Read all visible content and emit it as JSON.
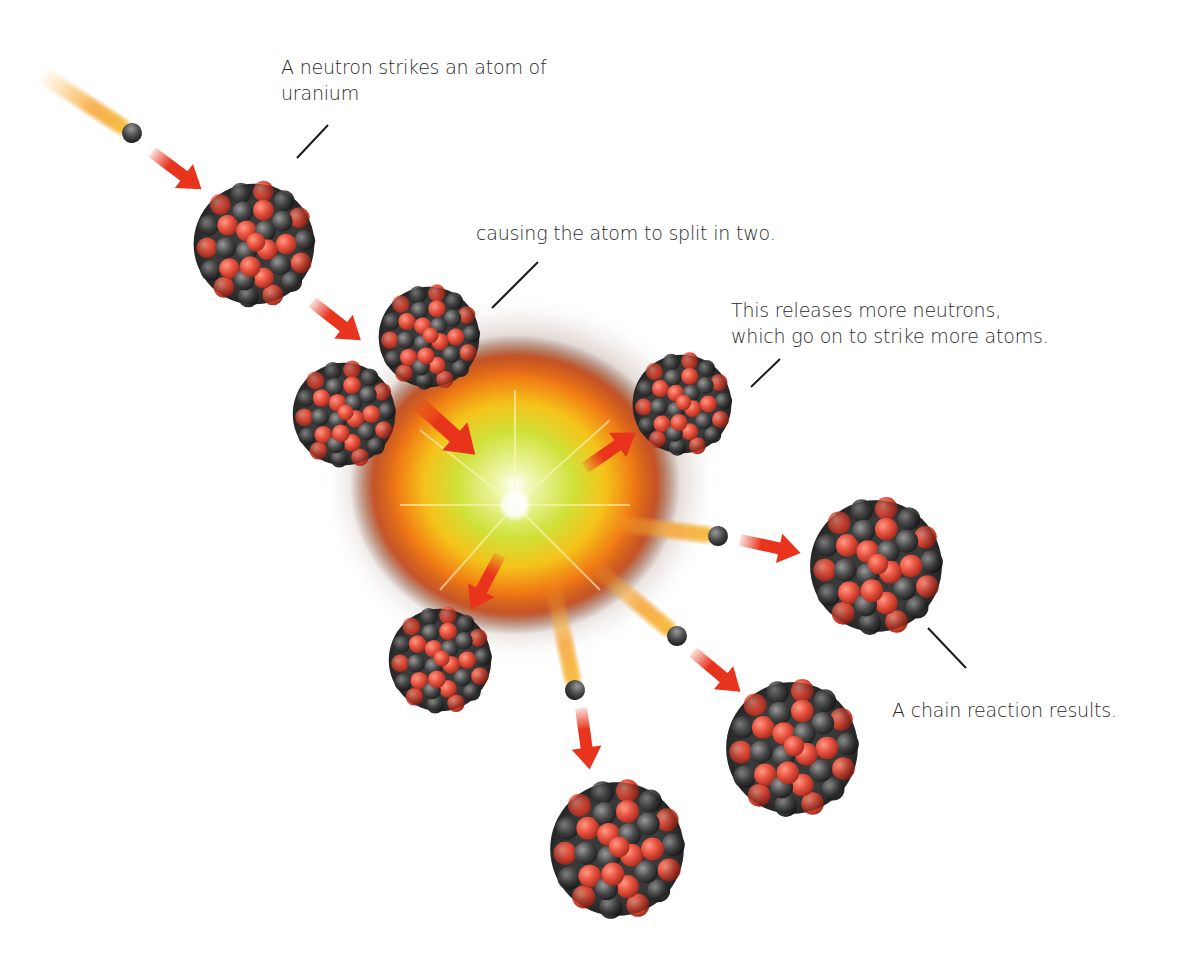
{
  "diagram": {
    "labels": [
      {
        "id": "neutron-strikes",
        "lines": [
          "A neutron strikes an atom of",
          "uranium"
        ],
        "x": 281,
        "y": 54
      },
      {
        "id": "atom-splits",
        "lines": [
          "causing the atom to split in two."
        ],
        "x": 476,
        "y": 220
      },
      {
        "id": "releases-neutrons",
        "lines": [
          "This releases more neutrons,",
          "which go on to strike more atoms."
        ],
        "x": 731,
        "y": 297
      },
      {
        "id": "chain-reaction",
        "lines": [
          "A chain reaction results."
        ],
        "x": 892,
        "y": 697
      }
    ],
    "colors": {
      "proton": "#e8523f",
      "neutron_particle": "#4a4a4a",
      "arrow": "#e8341c",
      "explosion_core": "#cfe23a",
      "explosion_mid": "#f59a1a",
      "explosion_outer": "#e0501a",
      "smoke": "#7a4a30",
      "trail": "#f7b733",
      "leader_line": "#1a1a1a"
    }
  }
}
